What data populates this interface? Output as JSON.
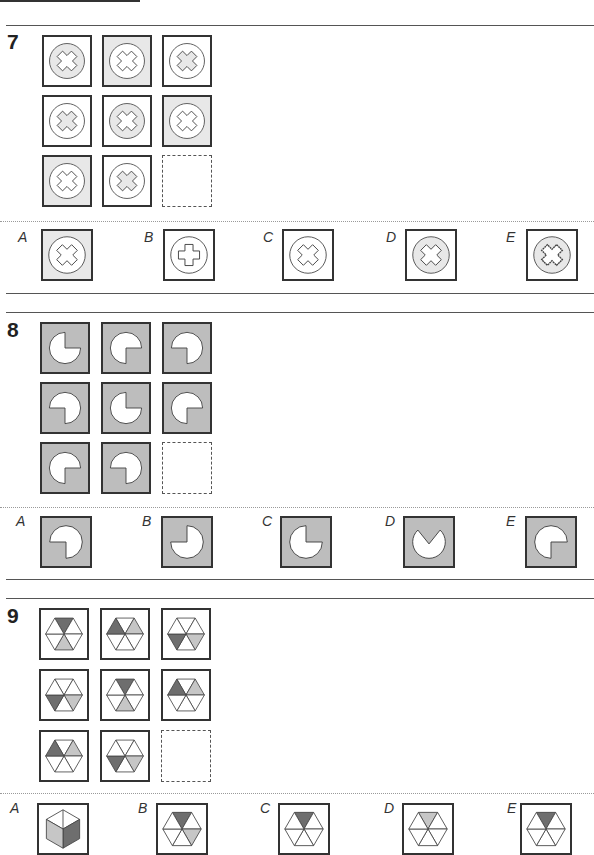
{
  "colors": {
    "shade": "#e8e8e8",
    "dark_shade": "#bdbdbd",
    "hex_dark": "#6e6e6e",
    "hex_light": "#c6c6c6",
    "line": "#333333"
  },
  "questions": [
    {
      "number": "7",
      "type": "cross-circle",
      "grid": [
        {
          "bg": false,
          "circle": true,
          "cross": false
        },
        {
          "bg": true,
          "circle": false,
          "cross": false
        },
        {
          "bg": false,
          "circle": false,
          "cross": true
        },
        {
          "bg": false,
          "circle": false,
          "cross": true
        },
        {
          "bg": false,
          "circle": true,
          "cross": false
        },
        {
          "bg": true,
          "circle": false,
          "cross": false
        },
        {
          "bg": true,
          "circle": false,
          "cross": false
        },
        {
          "bg": false,
          "circle": false,
          "cross": true
        },
        null
      ],
      "options": [
        {
          "label": "A",
          "bg": true,
          "circle": false,
          "cross": false,
          "shape": "x"
        },
        {
          "label": "B",
          "bg": false,
          "circle": false,
          "cross": false,
          "shape": "plus"
        },
        {
          "label": "C",
          "bg": false,
          "circle": false,
          "cross": false,
          "shape": "x"
        },
        {
          "label": "D",
          "bg": false,
          "circle": true,
          "cross": false,
          "shape": "x"
        },
        {
          "label": "E",
          "bg": false,
          "circle": true,
          "cross": false,
          "shape": "x-wavy"
        }
      ]
    },
    {
      "number": "8",
      "type": "pacman",
      "grid": [
        "top-right",
        "bottom-right",
        "bottom-left",
        "bottom-left",
        "top-right",
        "bottom-right",
        "bottom-right",
        "bottom-left",
        null
      ],
      "options": [
        {
          "label": "A",
          "missing": "bottom-left"
        },
        {
          "label": "B",
          "missing": "top-left"
        },
        {
          "label": "C",
          "missing": "top-right"
        },
        {
          "label": "D",
          "missing": "top-wedge"
        },
        {
          "label": "E",
          "missing": "bottom-right"
        }
      ]
    },
    {
      "number": "9",
      "type": "hexagon",
      "grid": [
        {
          "dark": 0,
          "light": 3
        },
        {
          "dark": 5,
          "light": 1
        },
        {
          "dark": 4,
          "light": 2
        },
        {
          "dark": 4,
          "light": 2
        },
        {
          "dark": 0,
          "light": 3
        },
        {
          "dark": 5,
          "light": 1
        },
        {
          "dark": 5,
          "light": 1
        },
        {
          "dark": 4,
          "light": 2
        },
        null
      ],
      "options": [
        {
          "label": "A",
          "style": "cube"
        },
        {
          "label": "B",
          "style": "hex",
          "dark": 0,
          "light": 2
        },
        {
          "label": "C",
          "style": "hex",
          "dark": 0,
          "light": null
        },
        {
          "label": "D",
          "style": "hex",
          "dark": null,
          "light": 0
        },
        {
          "label": "E",
          "style": "hex",
          "dark": 0,
          "light": null
        }
      ]
    }
  ]
}
